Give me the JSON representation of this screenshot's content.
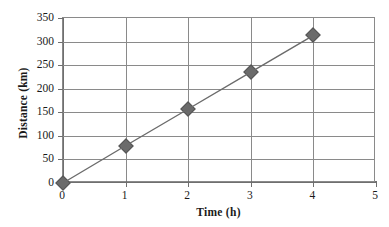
{
  "chart_data": {
    "type": "line",
    "title": "",
    "xlabel": "Time (h)",
    "ylabel": "Distance (km)",
    "x": [
      0,
      1,
      2,
      3,
      4
    ],
    "values": [
      0,
      79,
      157,
      235,
      313
    ],
    "series": [
      {
        "name": "Distance",
        "x": [
          0,
          1,
          2,
          3,
          4
        ],
        "values": [
          0,
          79,
          157,
          235,
          313
        ],
        "marker": "diamond",
        "color": "#6b6b6b",
        "line_color": "#6b6b6b"
      }
    ],
    "xlim": [
      0,
      5
    ],
    "ylim": [
      0,
      350
    ],
    "xticks": [
      0,
      1,
      2,
      3,
      4,
      5
    ],
    "yticks": [
      0,
      50,
      100,
      150,
      200,
      250,
      300,
      350
    ],
    "xtick_labels": [
      "0",
      "1",
      "2",
      "3",
      "4",
      "5"
    ],
    "ytick_labels": [
      "0",
      "50",
      "100",
      "150",
      "200",
      "250",
      "300",
      "350"
    ],
    "grid": "both",
    "legend": "none"
  },
  "axes": {
    "x_title": "Time (h)",
    "y_title": "Distance (km)"
  },
  "colors": {
    "marker": "#6b6b6b",
    "line": "#6b6b6b",
    "grid": "#8a8a8a",
    "axis": "#6f6f6f",
    "text": "#1a1a1a",
    "background": "#ffffff"
  }
}
